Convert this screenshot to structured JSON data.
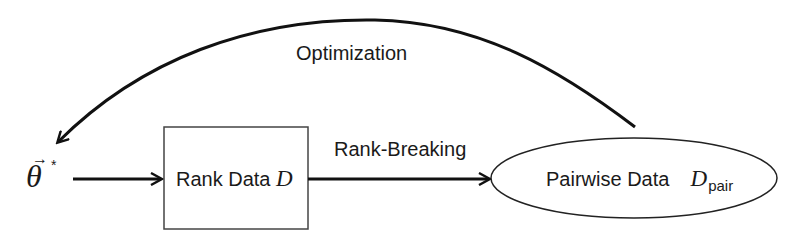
{
  "diagram": {
    "nodes": {
      "theta": {
        "symbol": "θ",
        "superscript": "*",
        "vector_arrow": "→"
      },
      "rank_data": {
        "label": "Rank Data",
        "symbol": "D"
      },
      "pairwise_data": {
        "label": "Pairwise Data",
        "symbol": "D",
        "subscript": "pair"
      }
    },
    "edges": {
      "theta_to_rank": {
        "label": ""
      },
      "rank_breaking": {
        "label": "Rank-Breaking"
      },
      "optimization": {
        "label": "Optimization"
      }
    }
  }
}
